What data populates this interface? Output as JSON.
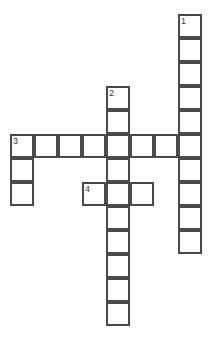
{
  "puzzle": {
    "type": "crossword-grid",
    "title": "",
    "cell_size_px": 24,
    "origin_x_px": 10,
    "origin_y_px": 14,
    "grid_columns": 9,
    "grid_rows": 13,
    "border_color": "#4a4a4a",
    "cell_fill": "#ffffff",
    "background": "#ffffff",
    "number_color": "#3a3a3a",
    "entries": [
      {
        "number": "1",
        "direction": "down",
        "start_col": 7,
        "start_row": 0,
        "length": 10,
        "answer": ""
      },
      {
        "number": "2",
        "direction": "down",
        "start_col": 4,
        "start_row": 3,
        "length": 10,
        "answer": ""
      },
      {
        "number": "3",
        "direction": "across",
        "start_col": 0,
        "start_row": 5,
        "length": 8,
        "answer": ""
      },
      {
        "number": "3",
        "direction": "down",
        "start_col": 0,
        "start_row": 5,
        "length": 3,
        "answer": ""
      },
      {
        "number": "4",
        "direction": "across",
        "start_col": 3,
        "start_row": 7,
        "length": 3,
        "answer": ""
      }
    ],
    "cells": [
      {
        "col": 7,
        "row": 0,
        "number": "1",
        "letter": ""
      },
      {
        "col": 7,
        "row": 1,
        "number": "",
        "letter": ""
      },
      {
        "col": 7,
        "row": 2,
        "number": "",
        "letter": ""
      },
      {
        "col": 7,
        "row": 3,
        "number": "",
        "letter": ""
      },
      {
        "col": 7,
        "row": 4,
        "number": "",
        "letter": ""
      },
      {
        "col": 7,
        "row": 5,
        "number": "",
        "letter": ""
      },
      {
        "col": 7,
        "row": 6,
        "number": "",
        "letter": ""
      },
      {
        "col": 7,
        "row": 7,
        "number": "",
        "letter": ""
      },
      {
        "col": 7,
        "row": 8,
        "number": "",
        "letter": ""
      },
      {
        "col": 7,
        "row": 9,
        "number": "",
        "letter": ""
      },
      {
        "col": 4,
        "row": 3,
        "number": "2",
        "letter": ""
      },
      {
        "col": 4,
        "row": 4,
        "number": "",
        "letter": ""
      },
      {
        "col": 4,
        "row": 5,
        "number": "",
        "letter": ""
      },
      {
        "col": 4,
        "row": 6,
        "number": "",
        "letter": ""
      },
      {
        "col": 4,
        "row": 7,
        "number": "",
        "letter": ""
      },
      {
        "col": 4,
        "row": 8,
        "number": "",
        "letter": ""
      },
      {
        "col": 4,
        "row": 9,
        "number": "",
        "letter": ""
      },
      {
        "col": 4,
        "row": 10,
        "number": "",
        "letter": ""
      },
      {
        "col": 4,
        "row": 11,
        "number": "",
        "letter": ""
      },
      {
        "col": 4,
        "row": 12,
        "number": "",
        "letter": ""
      },
      {
        "col": 0,
        "row": 5,
        "number": "3",
        "letter": ""
      },
      {
        "col": 1,
        "row": 5,
        "number": "",
        "letter": ""
      },
      {
        "col": 2,
        "row": 5,
        "number": "",
        "letter": ""
      },
      {
        "col": 3,
        "row": 5,
        "number": "",
        "letter": ""
      },
      {
        "col": 5,
        "row": 5,
        "number": "",
        "letter": ""
      },
      {
        "col": 6,
        "row": 5,
        "number": "",
        "letter": ""
      },
      {
        "col": 0,
        "row": 6,
        "number": "",
        "letter": ""
      },
      {
        "col": 0,
        "row": 7,
        "number": "",
        "letter": ""
      },
      {
        "col": 3,
        "row": 7,
        "number": "4",
        "letter": ""
      },
      {
        "col": 5,
        "row": 7,
        "number": "",
        "letter": ""
      }
    ]
  }
}
